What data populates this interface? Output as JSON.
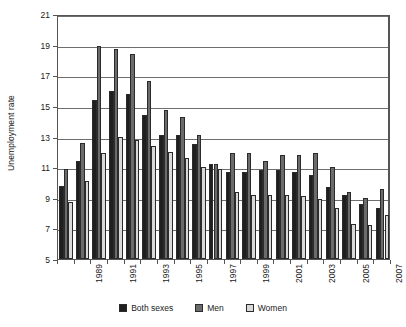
{
  "chart_data": {
    "type": "bar",
    "title": "",
    "xlabel": "",
    "ylabel": "Unemployment rate",
    "ylim": [
      5,
      21
    ],
    "ytick_step": 2,
    "yticks": [
      5,
      7,
      9,
      11,
      13,
      15,
      17,
      19,
      21
    ],
    "grid": true,
    "legend_position": "bottom",
    "categories": [
      "1989",
      "1990",
      "1991",
      "1992",
      "1993",
      "1994",
      "1995",
      "1996",
      "1997",
      "1998",
      "1999",
      "2000",
      "2001",
      "2002",
      "2003",
      "2004",
      "2005",
      "2006",
      "2007",
      "2008"
    ],
    "xtick_labels_shown": [
      "1989",
      "1991",
      "1993",
      "1995",
      "1997",
      "1999",
      "2001",
      "2003",
      "2005",
      "2007"
    ],
    "series": [
      {
        "name": "Both sexes",
        "color": "#1f1f1f",
        "values": [
          9.8,
          11.4,
          15.4,
          16.0,
          15.8,
          14.4,
          13.1,
          13.1,
          12.5,
          11.2,
          10.7,
          10.7,
          10.8,
          10.8,
          10.7,
          10.5,
          9.7,
          9.2,
          8.6,
          8.3
        ]
      },
      {
        "name": "Men",
        "color": "#6b6b6b",
        "values": [
          10.9,
          12.6,
          18.9,
          18.7,
          18.4,
          16.6,
          14.7,
          14.3,
          13.1,
          11.2,
          11.9,
          11.9,
          11.4,
          11.8,
          11.8,
          11.9,
          11.0,
          9.4,
          9.0,
          9.6
        ]
      },
      {
        "name": "Women",
        "color": "#d9d9d9",
        "values": [
          8.7,
          10.1,
          11.9,
          13.0,
          12.8,
          12.4,
          12.0,
          11.6,
          11.0,
          10.9,
          9.4,
          9.2,
          9.2,
          9.2,
          9.1,
          8.9,
          8.3,
          7.3,
          7.2,
          7.9
        ]
      }
    ]
  },
  "legend": {
    "items": [
      {
        "label": "Both sexes",
        "color": "#1f1f1f"
      },
      {
        "label": "Men",
        "color": "#6b6b6b"
      },
      {
        "label": "Women",
        "color": "#d9d9d9"
      }
    ]
  },
  "axis": {
    "y_title": "Unemployment rate"
  }
}
